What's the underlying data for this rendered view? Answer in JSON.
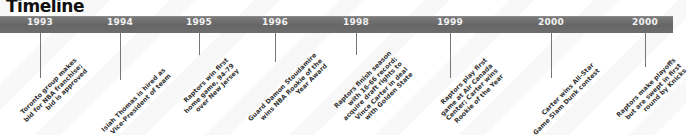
{
  "title": "Timeline",
  "colors": {
    "bar": "#6d6d6d",
    "year_text": "#f2f2f2",
    "tick": "#777777",
    "label_text": "#333333"
  },
  "events": [
    {
      "year": "1993",
      "lines": [
        "Toronto group makes",
        "bid for NBA franchise;",
        "bid is approved"
      ]
    },
    {
      "year": "1994",
      "lines": [
        "Isiah Thomas is hired as",
        "Vice-President of team"
      ]
    },
    {
      "year": "1995",
      "lines": [
        "Raptors win first",
        "home game, 94-79",
        "over New Jersey"
      ]
    },
    {
      "year": "1996",
      "lines": [
        "Guard Damon Stoudamire",
        "wins NBA Rookie of the",
        "Year Award"
      ]
    },
    {
      "year": "1998",
      "lines": [
        "Raptors finish season",
        "with 16-66 record;",
        "acquire draft rights to",
        "Vince Carter in deal",
        "with Golden State"
      ]
    },
    {
      "year": "1999",
      "lines": [
        "Raptors play first",
        "game at Air Canada",
        "Center; Carter wins",
        "Rookie of the Year"
      ]
    },
    {
      "year": "2000",
      "lines": [
        "Carter wins All-Star",
        "Game Slam Dunk contest"
      ]
    },
    {
      "year": "2000",
      "lines": [
        "Raptors make playoffs",
        "but are swept in first",
        "round by Knicks"
      ]
    }
  ]
}
